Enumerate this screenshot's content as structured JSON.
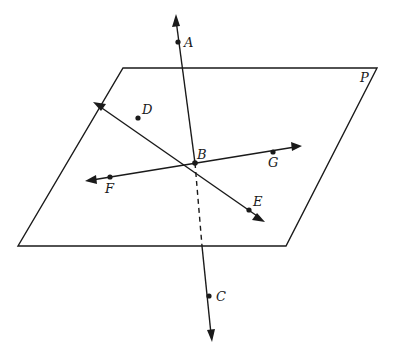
{
  "diagram": {
    "plane": {
      "label": "P"
    },
    "points": {
      "A": {
        "label": "A"
      },
      "B": {
        "label": "B"
      },
      "C": {
        "label": "C"
      },
      "D": {
        "label": "D"
      },
      "E": {
        "label": "E"
      },
      "F": {
        "label": "F"
      },
      "G": {
        "label": "G"
      }
    },
    "lines": [
      {
        "name": "line-AC",
        "through": [
          "A",
          "B",
          "C"
        ],
        "hidden_segment": "below plane"
      },
      {
        "name": "line-DE",
        "through": [
          "D",
          "B",
          "E"
        ]
      },
      {
        "name": "line-FG",
        "through": [
          "F",
          "B",
          "G"
        ]
      }
    ],
    "colors": {
      "stroke": "#1a1a1a",
      "background": "#ffffff"
    }
  }
}
